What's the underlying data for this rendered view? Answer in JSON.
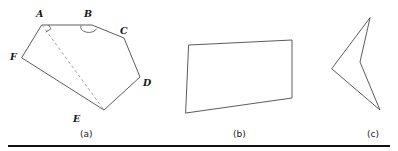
{
  "sheet": {
    "width": 398,
    "height": 151,
    "background": "#ffffff",
    "stroke_color": "#4a4a4a",
    "dashed_stroke_color": "#8a8a8a",
    "label_color": "#171717",
    "rule_color": "#111111"
  },
  "figures": [
    {
      "id": "figure-a",
      "caption": "(a)",
      "caption_x": 80,
      "caption_y": 137,
      "description": "convex hexagon ABCDEF with dashed diagonal AE, right-angle mark at A and reflex arc mark at B",
      "closed": true,
      "points": "42,25 92,25 124,38 140,77 104,110 22,58",
      "vertices": [
        {
          "name": "A",
          "label": "A",
          "x": 42,
          "y": 25,
          "label_x": 36,
          "label_y": 17
        },
        {
          "name": "B",
          "label": "B",
          "x": 92,
          "y": 25,
          "label_x": 84,
          "label_y": 17
        },
        {
          "name": "C",
          "label": "C",
          "x": 124,
          "y": 38,
          "label_x": 120,
          "label_y": 34
        },
        {
          "name": "D",
          "label": "D",
          "x": 140,
          "y": 77,
          "label_x": 143,
          "label_y": 86
        },
        {
          "name": "E",
          "label": "E",
          "x": 104,
          "y": 110,
          "label_x": 73,
          "label_y": 122
        },
        {
          "name": "F",
          "label": "F",
          "x": 22,
          "y": 58,
          "label_x": 10,
          "label_y": 60
        }
      ],
      "dashed_segments": [
        {
          "name": "diagonal-A-E",
          "x1": 42,
          "y1": 25,
          "x2": 104,
          "y2": 110
        }
      ],
      "angle_marks": [
        {
          "name": "angle-mark-A",
          "type": "square",
          "path": "M 45.6,32.2 L 51.0,28.8 L 48.4,25.0"
        },
        {
          "name": "angle-mark-B",
          "type": "reflex-arc",
          "path": "M 81.0,25.6 A 7.6,5.0 0 1 0 96.6,28.6"
        }
      ]
    },
    {
      "id": "figure-b",
      "caption": "(b)",
      "caption_x": 233,
      "caption_y": 137,
      "description": "crossed bowtie quadrilateral",
      "closed": true,
      "points": "189,45 292,40 292,98 186,113",
      "vertices": [],
      "dashed_segments": [],
      "angle_marks": []
    },
    {
      "id": "figure-c",
      "caption": "(c)",
      "caption_x": 367,
      "caption_y": 137,
      "description": "concave dart / arrowhead quadrilateral",
      "closed": true,
      "points": "370,18 360,62 380,110 332,69",
      "vertices": [],
      "dashed_segments": [],
      "angle_marks": []
    }
  ],
  "bottom_rule": {
    "name": "bottom-rule",
    "x1": 8,
    "y1": 146,
    "x2": 390,
    "y2": 146
  }
}
